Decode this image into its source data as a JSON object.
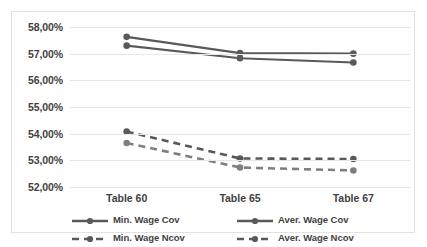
{
  "chart_data": {
    "type": "line",
    "title": "",
    "xlabel": "",
    "ylabel": "",
    "categories": [
      "Table 60",
      "Table 65",
      "Table 67"
    ],
    "ylim": [
      52.0,
      58.0
    ],
    "ytick_values": [
      52.0,
      53.0,
      54.0,
      55.0,
      56.0,
      57.0,
      58.0
    ],
    "ytick_labels": [
      "52,00%",
      "53,00%",
      "54,00%",
      "55,00%",
      "56,00%",
      "57,00%",
      "58,00%"
    ],
    "grid": true,
    "legend_position": "bottom",
    "series": [
      {
        "name": "Min. Wage Cov",
        "values": [
          57.63,
          57.02,
          57.0
        ],
        "style": "solid",
        "color": "#595959",
        "marker": "circle"
      },
      {
        "name": "Aver. Wage Cov",
        "values": [
          57.3,
          56.83,
          56.67
        ],
        "style": "solid",
        "color": "#595959",
        "marker": "circle"
      },
      {
        "name": "Min. Wage Ncov",
        "values": [
          54.08,
          53.07,
          53.05
        ],
        "style": "dashed",
        "color": "#595959",
        "marker": "circle"
      },
      {
        "name": "Aver. Wage Ncov",
        "values": [
          53.65,
          52.73,
          52.62
        ],
        "style": "dashed",
        "color": "#7f7f7f",
        "marker": "circle"
      }
    ]
  },
  "legend": {
    "entries": [
      {
        "label": "Min. Wage Cov",
        "style": "solid"
      },
      {
        "label": "Aver. Wage Cov",
        "style": "solid"
      },
      {
        "label": "Min. Wage Ncov",
        "style": "dashed"
      },
      {
        "label": "Aver. Wage Ncov",
        "style": "dashed"
      }
    ]
  },
  "colors": {
    "plot_background": "#ffffff",
    "frame_border": "#e2e2e2",
    "gridline": "#e6e6e6",
    "text": "#3f3f3f",
    "series_dark": "#595959",
    "series_light": "#7f7f7f"
  }
}
